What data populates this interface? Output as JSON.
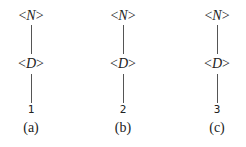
{
  "trees": [
    {
      "root": "N",
      "child": "D",
      "leaf": "1",
      "caption": "(a)"
    },
    {
      "root": "N",
      "child": "D",
      "leaf": "2",
      "caption": "(b)"
    },
    {
      "root": "N",
      "child": "D",
      "leaf": "3",
      "caption": "(c)"
    }
  ],
  "bracket_open": "<",
  "bracket_close": ">"
}
